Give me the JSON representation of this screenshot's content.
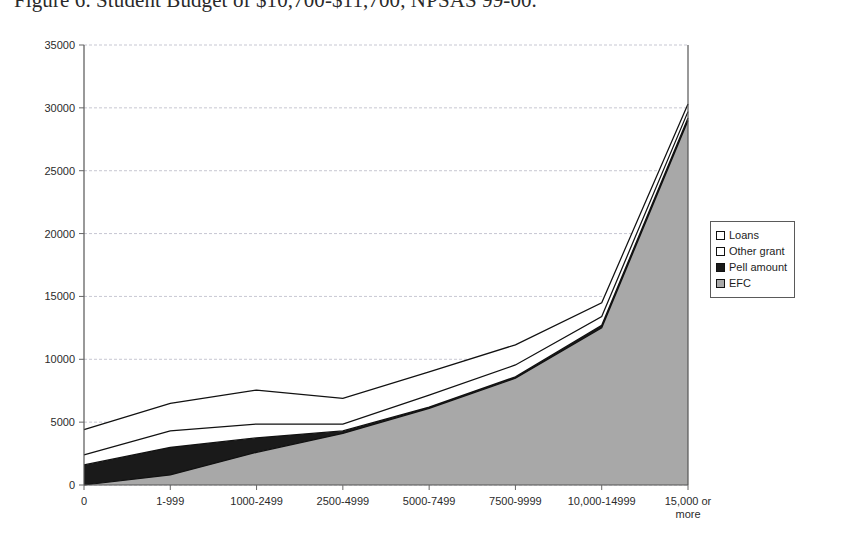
{
  "figure": {
    "caption": "Figure 6.  Student Budget of $10,700-$11,700, NPSAS 99-00."
  },
  "legend": {
    "position": "right",
    "items": [
      {
        "label": "Loans",
        "swatch": "legend-swatch-loans",
        "color": "#ffffff"
      },
      {
        "label": "Other grant",
        "swatch": "legend-swatch-other-grant",
        "color": "#ffffff"
      },
      {
        "label": "Pell amount",
        "swatch": "legend-swatch-pell-amount",
        "color": "#1a1a1a"
      },
      {
        "label": "EFC",
        "swatch": "legend-swatch-efc",
        "color": "#a8a8a8"
      }
    ]
  },
  "chart_data": {
    "type": "area",
    "stacked": true,
    "title": "Figure 6.  Student Budget of $10,700-$11,700, NPSAS 99-00.",
    "xlabel": "",
    "ylabel": "",
    "ylim": [
      0,
      35000
    ],
    "yticks": [
      0,
      5000,
      10000,
      15000,
      20000,
      25000,
      30000,
      35000
    ],
    "ytick_labels": [
      "0",
      "5000",
      "10000",
      "15000",
      "20000",
      "25000",
      "30000",
      "35000"
    ],
    "grid": true,
    "categories": [
      "0",
      "1-999",
      "1000-2499",
      "2500-4999",
      "5000-7499",
      "7500-9999",
      "10,000-14999",
      "15,000 or more"
    ],
    "series": [
      {
        "name": "EFC",
        "color": "#a8a8a8",
        "values": [
          0,
          800,
          2600,
          4100,
          6100,
          8500,
          12500,
          29000
        ]
      },
      {
        "name": "Pell amount",
        "color": "#1a1a1a",
        "values": [
          1600,
          2200,
          1150,
          200,
          100,
          100,
          200,
          200
        ]
      },
      {
        "name": "Other grant",
        "color": "#ffffff",
        "values": [
          800,
          1300,
          1100,
          550,
          950,
          950,
          700,
          500
        ]
      },
      {
        "name": "Loans",
        "color": "#ffffff",
        "values": [
          2000,
          2200,
          2700,
          2050,
          1850,
          1600,
          1100,
          600
        ]
      }
    ],
    "cumulative_tops": {
      "EFC": [
        0,
        800,
        2600,
        4100,
        6100,
        8500,
        12500,
        29000
      ],
      "Pell amount": [
        1600,
        3000,
        3750,
        4300,
        6200,
        8600,
        12700,
        29200
      ],
      "Other grant": [
        2400,
        4300,
        4850,
        4850,
        7150,
        9550,
        13400,
        29700
      ],
      "Loans": [
        4400,
        6500,
        7550,
        6900,
        9000,
        11150,
        14500,
        30300
      ]
    }
  }
}
